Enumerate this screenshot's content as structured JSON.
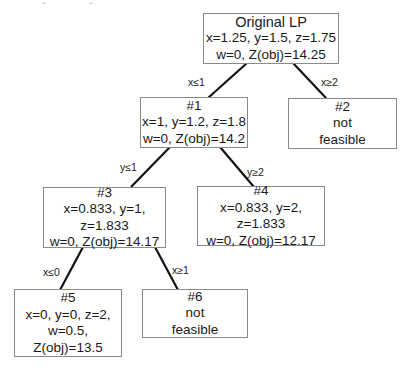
{
  "diagram": {
    "type": "branch-and-bound-tree",
    "nodes": [
      {
        "id": "root",
        "lines": [
          "Original LP",
          "x=1.25, y=1.5, z=1.75",
          "w=0, Z(obj)=14.25"
        ]
      },
      {
        "id": "n1",
        "lines": [
          "#1",
          "x=1, y=1.2, z=1.8",
          "w=0, Z(obj)=14.2"
        ]
      },
      {
        "id": "n2",
        "lines": [
          "#2",
          "not",
          "feasible"
        ]
      },
      {
        "id": "n3",
        "lines": [
          "#3",
          "x=0.833, y=1,",
          "z=1.833",
          "w=0, Z(obj)=14.17"
        ]
      },
      {
        "id": "n4",
        "lines": [
          "#4",
          "x=0.833, y=2,",
          "z=1.833",
          "w=0, Z(obj)=12.17"
        ]
      },
      {
        "id": "n5",
        "lines": [
          "#5",
          "x=0, y=0, z=2,",
          "w=0.5,",
          "Z(obj)=13.5"
        ]
      },
      {
        "id": "n6",
        "lines": [
          "#6",
          "not",
          "feasible"
        ]
      }
    ],
    "edges": [
      {
        "from": "root",
        "to": "n1",
        "label": "x≤1"
      },
      {
        "from": "root",
        "to": "n2",
        "label": "x≥2"
      },
      {
        "from": "n1",
        "to": "n3",
        "label": "y≤1"
      },
      {
        "from": "n1",
        "to": "n4",
        "label": "y≥2"
      },
      {
        "from": "n3",
        "to": "n5",
        "label": "x≤0"
      },
      {
        "from": "n3",
        "to": "n6",
        "label": "x≥1"
      }
    ],
    "colors": {
      "edge": "#111111",
      "border": "#8a8a8a",
      "text": "#1a1a1a"
    }
  }
}
